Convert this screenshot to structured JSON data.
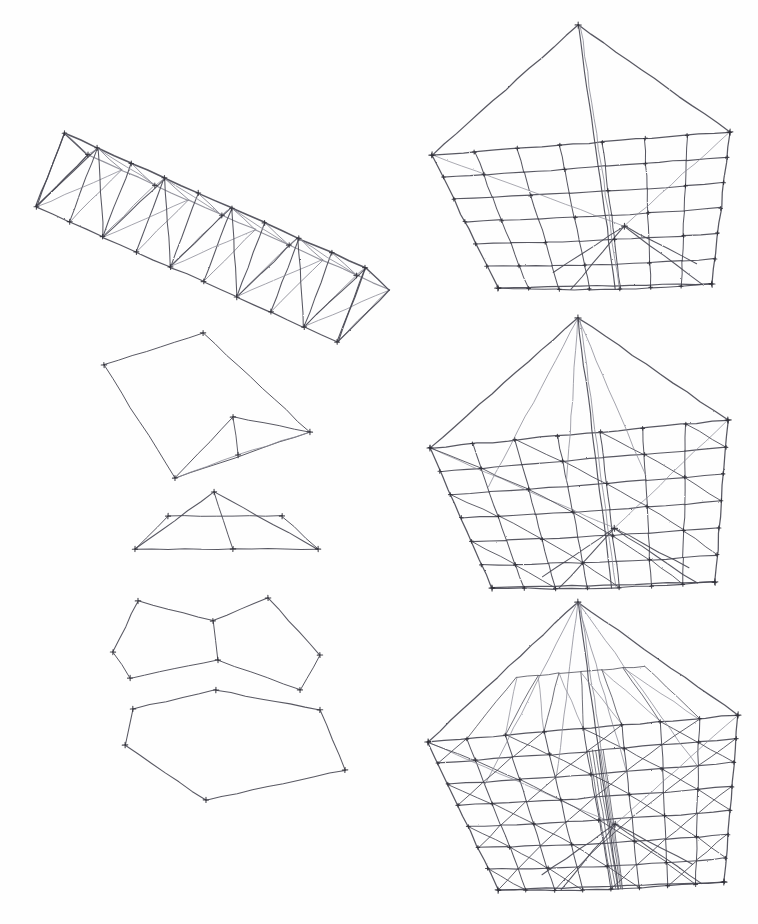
{
  "page": {
    "medium": "pencil-on-paper",
    "background_color": "#fefefe",
    "stroke_color": "#4a4a55",
    "stroke_color_light": "#8b8b96",
    "width": 758,
    "height": 924,
    "caption": ""
  },
  "figures": [
    {
      "id": "space-truss",
      "name": "3d-space-truss",
      "label": "",
      "bbox": [
        30,
        95,
        350,
        290
      ],
      "description": "Isometric triangular prismatic space truss with 9 bays, top chord ridge line and cross-braced side panels",
      "bays": 9,
      "stroke_weight": 1.0
    },
    {
      "id": "tent-mesh-coarse",
      "name": "tent-mesh-coarse",
      "label": "",
      "bbox": [
        420,
        20,
        740,
        310
      ],
      "description": "Pentagonal tent surface mesh, coarse subdivision, single interior ridge node",
      "rows": 7,
      "cols": 7,
      "stroke_weight": 1.0
    },
    {
      "id": "outline-step-1",
      "name": "quad-outline-step-1",
      "label": "",
      "bbox": [
        100,
        330,
        320,
        485
      ],
      "description": "Base quadrilateral outline with small apex triangle overlay",
      "stroke_weight": 0.9
    },
    {
      "id": "outline-step-2",
      "name": "quad-outline-step-2",
      "label": "",
      "bbox": [
        125,
        487,
        320,
        560
      ],
      "description": "Trapezoidal outline with apex and centre vertical strut",
      "stroke_weight": 0.9
    },
    {
      "id": "tent-mesh-medium",
      "name": "tent-mesh-medium",
      "label": "",
      "bbox": [
        415,
        315,
        740,
        600
      ],
      "description": "Pentagonal tent surface mesh, medium subdivision with diagonal bracing fan",
      "rows": 7,
      "cols": 7,
      "stroke_weight": 1.0
    },
    {
      "id": "outline-step-3",
      "name": "quad-outline-step-3",
      "label": "",
      "bbox": [
        110,
        560,
        335,
        700
      ],
      "description": "Wider pentagon outline with apex and centre vertical strut",
      "stroke_weight": 0.9
    },
    {
      "id": "outline-step-4",
      "name": "quad-outline-step-4",
      "label": "",
      "bbox": [
        115,
        630,
        345,
        810
      ],
      "description": "Largest flattened pentagon outline, no interior subdivision",
      "stroke_weight": 0.9
    },
    {
      "id": "tent-mesh-fine",
      "name": "tent-mesh-fine",
      "label": "",
      "bbox": [
        410,
        595,
        750,
        905
      ],
      "description": "Pentagonal tent surface mesh, fine subdivision with full diagonal bracing",
      "rows": 8,
      "cols": 8,
      "stroke_weight": 1.0
    }
  ]
}
